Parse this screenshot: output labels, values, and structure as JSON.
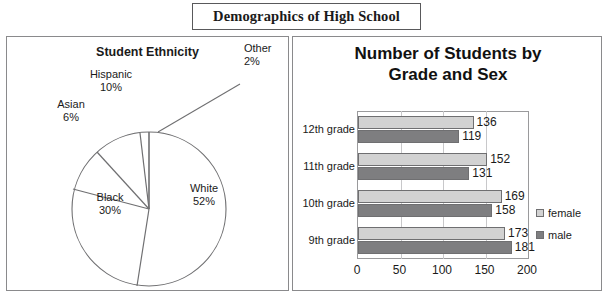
{
  "header": {
    "title": "Demographics of High School"
  },
  "pie_panel": {
    "title": "Student Ethnicity"
  },
  "bar_panel": {
    "title_line1": "Number of Students by",
    "title_line2": "Grade and Sex"
  },
  "legend": {
    "items": [
      {
        "label": "female",
        "swatch": "female"
      },
      {
        "label": "male",
        "swatch": "male"
      }
    ]
  },
  "colors": {
    "female_bar": "#d2d2d2",
    "male_bar": "#7e7e80",
    "panel_border": "#8a8a8c",
    "title_border": "#59595b",
    "gridline": "#c8c8ca",
    "pie_stroke": "#6f6f71"
  },
  "chart_data": [
    {
      "type": "pie",
      "title": "Student Ethnicity",
      "categories": [
        "White",
        "Black",
        "Hispanic",
        "Asian",
        "Other"
      ],
      "values": [
        52,
        30,
        10,
        6,
        2
      ],
      "unit": "percent",
      "labels": [
        {
          "name": "White",
          "pct": "52%"
        },
        {
          "name": "Black",
          "pct": "30%"
        },
        {
          "name": "Hispanic",
          "pct": "10%"
        },
        {
          "name": "Asian",
          "pct": "6%"
        },
        {
          "name": "Other",
          "pct": "2%"
        }
      ],
      "legend": "none",
      "notes": "Unfilled white slices with thin gray outlines; 'Other' label connected by a leader line."
    },
    {
      "type": "bar",
      "orientation": "horizontal",
      "title": "Number of Students by Grade and Sex",
      "categories": [
        "12th grade",
        "11th grade",
        "10th grade",
        "9th grade"
      ],
      "series": [
        {
          "name": "female",
          "values": [
            136,
            152,
            169,
            173
          ]
        },
        {
          "name": "male",
          "values": [
            119,
            131,
            158,
            181
          ]
        }
      ],
      "xlabel": "",
      "ylabel": "",
      "xlim": [
        0,
        200
      ],
      "xticks": [
        0,
        50,
        100,
        150,
        200
      ],
      "xtick_labels": [
        "0",
        "50",
        "100",
        "150",
        "200"
      ],
      "grid": true,
      "legend_position": "right",
      "data_labels": true
    }
  ]
}
